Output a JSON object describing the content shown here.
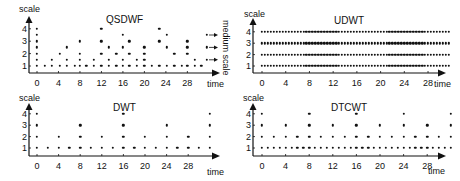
{
  "figure": {
    "panels": [
      {
        "id": "qsdwf",
        "title": "QSDWF",
        "ylabel": "scale",
        "xlabel": "time",
        "side_label": "medium scale",
        "yticks": [
          "1",
          "2",
          "3",
          "4"
        ],
        "xticks": [
          "0",
          "4",
          "8",
          "12",
          "16",
          "20",
          "24",
          "28"
        ]
      },
      {
        "id": "udwt",
        "title": "UDWT",
        "ylabel": "scale",
        "xlabel": "time",
        "yticks": [
          "1",
          "2",
          "3",
          "4"
        ],
        "xticks": [
          "0",
          "4",
          "8",
          "12",
          "16",
          "20",
          "24",
          "28"
        ]
      },
      {
        "id": "dwt",
        "title": "DWT",
        "ylabel": "scale",
        "xlabel": "time",
        "yticks": [
          "1",
          "2",
          "3",
          "4"
        ],
        "xticks": [
          "0",
          "4",
          "8",
          "12",
          "16",
          "20",
          "24",
          "28"
        ]
      },
      {
        "id": "dtcwt",
        "title": "DTCWT",
        "ylabel": "scale",
        "xlabel": "time",
        "yticks": [
          "1",
          "2",
          "3",
          "4"
        ],
        "xticks": [
          "0",
          "4",
          "8",
          "12",
          "16",
          "20",
          "24",
          "28"
        ]
      }
    ]
  },
  "chart_data": [
    {
      "type": "scatter",
      "title": "QSDWF",
      "xlabel": "time",
      "ylabel": "scale",
      "xlim": [
        0,
        31
      ],
      "ylim": [
        1,
        4
      ],
      "note": "scale samples at half-octave steps (1, 1.5, ... 4) with arrows pointing right at medium scales 1.5, 2.5, 3.5",
      "columns": [
        {
          "x": 0,
          "levels": [
            1,
            1.5,
            2,
            2.5,
            3,
            3.5,
            4
          ]
        },
        {
          "x": 1.4,
          "levels": [
            1
          ]
        },
        {
          "x": 2.8,
          "levels": [
            1,
            1.5
          ]
        },
        {
          "x": 4.2,
          "levels": [
            1,
            2
          ]
        },
        {
          "x": 5.6,
          "levels": [
            1,
            1.5,
            2.5
          ]
        },
        {
          "x": 7.0,
          "levels": [
            1
          ]
        },
        {
          "x": 8.0,
          "levels": [
            1,
            1.5,
            2,
            3
          ]
        },
        {
          "x": 9.2,
          "levels": [
            1
          ]
        },
        {
          "x": 10.6,
          "levels": [
            1,
            1.5
          ]
        },
        {
          "x": 12.0,
          "levels": [
            1,
            2,
            3,
            4
          ]
        },
        {
          "x": 13.4,
          "levels": [
            1,
            1.5,
            2.5
          ]
        },
        {
          "x": 14.8,
          "levels": [
            1,
            2
          ]
        },
        {
          "x": 16.0,
          "levels": [
            1,
            1.5,
            2.5,
            3.5
          ]
        },
        {
          "x": 17.2,
          "levels": [
            1,
            2,
            3
          ]
        },
        {
          "x": 18.6,
          "levels": [
            1,
            1.5
          ]
        },
        {
          "x": 20.0,
          "levels": [
            1,
            1.5,
            2,
            2.5
          ]
        },
        {
          "x": 21.4,
          "levels": [
            1
          ]
        },
        {
          "x": 22.8,
          "levels": [
            1,
            3,
            4
          ]
        },
        {
          "x": 24.2,
          "levels": [
            1,
            2.5,
            3.5
          ]
        },
        {
          "x": 25.6,
          "levels": [
            1,
            2
          ]
        },
        {
          "x": 27.0,
          "levels": [
            1
          ]
        },
        {
          "x": 28.0,
          "levels": [
            1,
            2,
            2.5,
            3
          ]
        },
        {
          "x": 29.4,
          "levels": [
            1,
            1.5
          ]
        },
        {
          "x": 30.6,
          "levels": [
            1
          ]
        },
        {
          "x": 31.6,
          "levels": [
            1.5,
            2.5,
            3.5
          ]
        }
      ]
    },
    {
      "type": "scatter",
      "title": "UDWT",
      "xlabel": "time",
      "ylabel": "scale",
      "xlim": [
        0,
        31.5
      ],
      "ylim": [
        1,
        4
      ],
      "rows": [
        {
          "level": 1,
          "step": 0.5
        },
        {
          "level": 2,
          "step": 0.5
        },
        {
          "level": 3,
          "step": 0.5
        },
        {
          "level": 4,
          "step": 0.5
        }
      ]
    },
    {
      "type": "scatter",
      "title": "DWT",
      "xlabel": "time",
      "ylabel": "scale",
      "xlim": [
        0,
        32
      ],
      "ylim": [
        1,
        4
      ],
      "rows": [
        {
          "level": 1,
          "step": 2
        },
        {
          "level": 2,
          "step": 4
        },
        {
          "level": 3,
          "step": 8
        },
        {
          "level": 4,
          "step": 16
        }
      ]
    },
    {
      "type": "scatter",
      "title": "DTCWT",
      "xlabel": "time",
      "ylabel": "scale",
      "xlim": [
        0,
        32
      ],
      "ylim": [
        1,
        4
      ],
      "rows": [
        {
          "level": 1,
          "step": 1
        },
        {
          "level": 2,
          "step": 2
        },
        {
          "level": 3,
          "step": 4
        },
        {
          "level": 4,
          "step": 8
        }
      ]
    }
  ]
}
